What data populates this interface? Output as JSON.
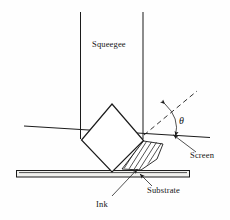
{
  "figure": {
    "background_color": "#fefefe",
    "line_color": "#1b1b1b",
    "width": 230,
    "height": 220
  },
  "labels": {
    "squeegee": "Squeegee",
    "theta": "θ",
    "screen": "Screen",
    "substrate": "Substrate",
    "ink": "Ink"
  },
  "diagram_data": {
    "type": "technical-diagram",
    "components": [
      {
        "name": "squeegee-shaft",
        "label": "Squeegee",
        "shape": "two-vertical-parallel-lines",
        "left_x": 80,
        "right_x": 143,
        "top_y": 12,
        "bottom_y": 140
      },
      {
        "name": "squeegee-blade",
        "shape": "diamond",
        "vertices": [
          [
            112,
            104
          ],
          [
            143,
            140
          ],
          [
            112,
            172
          ],
          [
            82,
            140
          ]
        ]
      },
      {
        "name": "screen-line",
        "shape": "line",
        "from": [
          24,
          126
        ],
        "to": [
          210,
          137
        ],
        "note": "passes through blade contact point"
      },
      {
        "name": "substrate-bar",
        "shape": "rectangle",
        "x": 16,
        "y": 170,
        "width": 174,
        "height": 7
      },
      {
        "name": "ink-region",
        "shape": "hatched-wedge",
        "hatch_angle_deg": 55,
        "note": "between blade face, screen and substrate"
      },
      {
        "name": "angle-theta",
        "label": "θ",
        "shape": "double-arrow-arc",
        "between": [
          "dashed-reference-line",
          "screen-line"
        ],
        "vertex": [
          155,
          117
        ]
      },
      {
        "name": "dashed-reference-line",
        "shape": "dashed-line",
        "from": [
          143,
          134
        ],
        "to": [
          196,
          92
        ]
      }
    ],
    "leaders": [
      {
        "name": "screen-leader",
        "from": [
          196,
          152
        ],
        "to": [
          172,
          134
        ],
        "label": "Screen"
      },
      {
        "name": "substrate-leader",
        "from": [
          152,
          186
        ],
        "to": [
          139,
          173
        ],
        "label": "Substrate"
      },
      {
        "name": "ink-leader",
        "from": [
          113,
          196
        ],
        "to": [
          137,
          169
        ],
        "label": "Ink"
      }
    ]
  }
}
